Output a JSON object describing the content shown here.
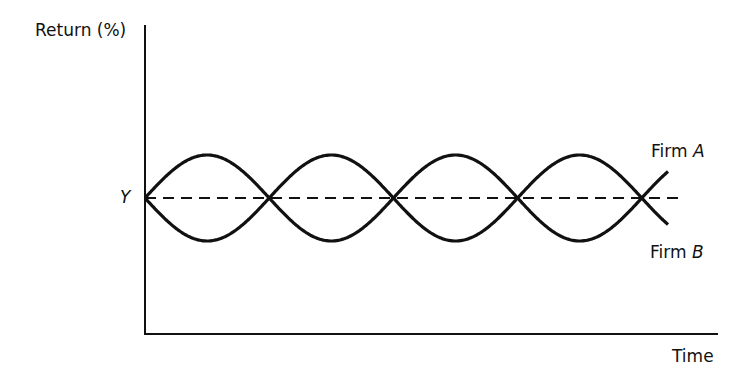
{
  "chart_data": {
    "type": "line",
    "title": "",
    "xlabel": "Time",
    "ylabel": "Return (%)",
    "y_reference": {
      "label": "Y",
      "style": "dashed"
    },
    "grid": false,
    "series": [
      {
        "name": "Firm A",
        "label_prefix": "Firm ",
        "label_letter": "A",
        "shape": "sinusoid above Y first",
        "periods": 2.2
      },
      {
        "name": "Firm B",
        "label_prefix": "Firm ",
        "label_letter": "B",
        "shape": "sinusoid below Y first (mirror of A)",
        "periods": 2.2
      }
    ],
    "crossings_at_Y": 5
  },
  "labels": {
    "ylabel": "Return (%)",
    "xlabel": "Time",
    "y_ref": "Y",
    "firmA_prefix": "Firm ",
    "firmA_letter": "A",
    "firmB_prefix": "Firm ",
    "firmB_letter": "B"
  }
}
